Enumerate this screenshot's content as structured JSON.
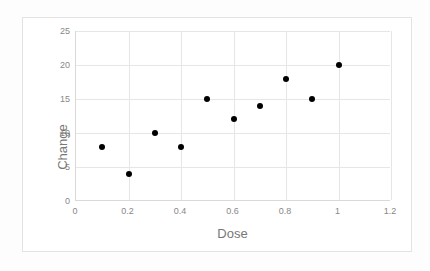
{
  "chart_data": {
    "type": "scatter",
    "title": "",
    "xlabel": "Dose",
    "ylabel": "Change",
    "xlim": [
      0,
      1.2
    ],
    "ylim": [
      0,
      25
    ],
    "xticks": [
      "0",
      "0.2",
      "0.4",
      "0.6",
      "0.8",
      "1",
      "1.2"
    ],
    "xtick_values": [
      0,
      0.2,
      0.4,
      0.6,
      0.8,
      1,
      1.2
    ],
    "yticks": [
      "0",
      "5",
      "10",
      "15",
      "20",
      "25"
    ],
    "ytick_values": [
      0,
      5,
      10,
      15,
      20,
      25
    ],
    "grid": "both",
    "legend": "none",
    "marker": "filled-circle",
    "marker_color": "#000000",
    "gridline_color": "#e6e6e6",
    "axis_color": "#d9d9d9",
    "label_color": "#888888",
    "title_color": "#777777",
    "x": [
      0.1,
      0.2,
      0.3,
      0.4,
      0.5,
      0.6,
      0.7,
      0.8,
      0.9,
      1.0
    ],
    "y": [
      8,
      4,
      10,
      8,
      15,
      12,
      14,
      18,
      15,
      20
    ],
    "points": [
      {
        "x": 0.1,
        "y": 8
      },
      {
        "x": 0.2,
        "y": 4
      },
      {
        "x": 0.3,
        "y": 10
      },
      {
        "x": 0.4,
        "y": 8
      },
      {
        "x": 0.5,
        "y": 15
      },
      {
        "x": 0.6,
        "y": 12
      },
      {
        "x": 0.7,
        "y": 14
      },
      {
        "x": 0.8,
        "y": 18
      },
      {
        "x": 0.9,
        "y": 15
      },
      {
        "x": 1.0,
        "y": 20
      }
    ]
  }
}
